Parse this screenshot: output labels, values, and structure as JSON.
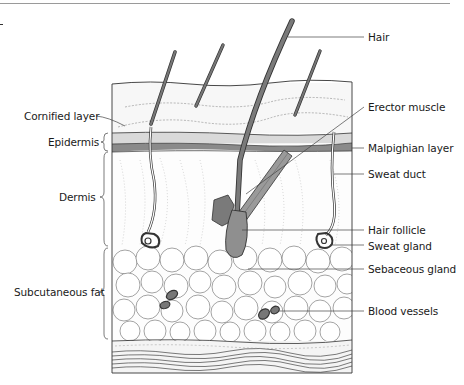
{
  "figure": {
    "labels_left": [
      {
        "id": "cornified",
        "text": "Cornified layer",
        "x": 12,
        "y": 111
      },
      {
        "id": "epidermis",
        "text": "Epidermis",
        "x": 36,
        "y": 134
      },
      {
        "id": "dermis",
        "text": "Dermis",
        "x": 59,
        "y": 193
      },
      {
        "id": "subcutaneous",
        "text": "Subcutaneous fat",
        "x": 14,
        "y": 289
      }
    ],
    "labels_right": [
      {
        "id": "hair",
        "text": "Hair",
        "x": 368,
        "y": 32
      },
      {
        "id": "erector",
        "text": "Erector muscle",
        "x": 368,
        "y": 102
      },
      {
        "id": "malpighian",
        "text": "Malpighian layer",
        "x": 368,
        "y": 144
      },
      {
        "id": "sweat-duct",
        "text": "Sweat duct",
        "x": 368,
        "y": 169
      },
      {
        "id": "hair-follicle",
        "text": "Hair follicle",
        "x": 368,
        "y": 225
      },
      {
        "id": "sweat-gland",
        "text": "Sweat gland",
        "x": 368,
        "y": 241
      },
      {
        "id": "sebaceous",
        "text": "Sebaceous gland",
        "x": 368,
        "y": 264
      },
      {
        "id": "blood-vessels",
        "text": "Blood vessels",
        "x": 368,
        "y": 306
      }
    ],
    "colors": {
      "outline": "#333333",
      "epidermis_light": "#d9d9d9",
      "malpighian_dark": "#8a8a8a",
      "hair": "#6e6e6e",
      "follicle": "#8f8f8f",
      "sebaceous": "#7a7a7a",
      "fat_cell": "#ffffff"
    }
  }
}
